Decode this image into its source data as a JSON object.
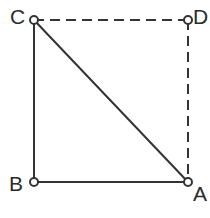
{
  "figure": {
    "background_color": "#ffffff",
    "stroke_color": "#333333",
    "label_color": "#2b2b2b",
    "marker_fill": "#ffffff",
    "marker_radius": 4,
    "stroke_width": 2,
    "dash_pattern": "10 6",
    "vertices": [
      {
        "id": "C",
        "label": "C",
        "x": 34,
        "y": 20,
        "label_x": 10,
        "label_y": 6
      },
      {
        "id": "D",
        "label": "D",
        "x": 188,
        "y": 20,
        "label_x": 193,
        "label_y": 6
      },
      {
        "id": "B",
        "label": "B",
        "x": 34,
        "y": 182,
        "label_x": 9,
        "label_y": 173
      },
      {
        "id": "A",
        "label": "A",
        "x": 188,
        "y": 182,
        "label_x": 193,
        "label_y": 183
      }
    ],
    "edges": [
      {
        "id": "CB",
        "from": "C",
        "to": "B",
        "style": "solid",
        "x1": 34,
        "y1": 20,
        "x2": 34,
        "y2": 182
      },
      {
        "id": "BA",
        "from": "B",
        "to": "A",
        "style": "solid",
        "x1": 34,
        "y1": 182,
        "x2": 188,
        "y2": 182
      },
      {
        "id": "CA",
        "from": "C",
        "to": "A",
        "style": "solid",
        "x1": 34,
        "y1": 20,
        "x2": 188,
        "y2": 182
      },
      {
        "id": "CD",
        "from": "C",
        "to": "D",
        "style": "dashed",
        "x1": 34,
        "y1": 20,
        "x2": 188,
        "y2": 20
      },
      {
        "id": "DA",
        "from": "D",
        "to": "A",
        "style": "dashed",
        "x1": 188,
        "y1": 20,
        "x2": 188,
        "y2": 182
      }
    ]
  }
}
